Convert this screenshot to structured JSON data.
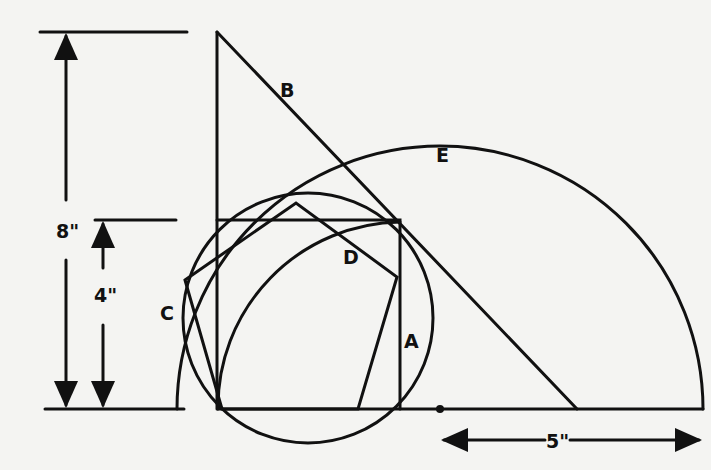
{
  "diagram": {
    "labels": {
      "A": "A",
      "B": "B",
      "C": "C",
      "D": "D",
      "E": "E"
    },
    "dimensions": {
      "height_full": "8\"",
      "height_half": "4\"",
      "radius": "5\""
    },
    "colors": {
      "background": "#f4f4f2",
      "ink": "#111111"
    }
  }
}
